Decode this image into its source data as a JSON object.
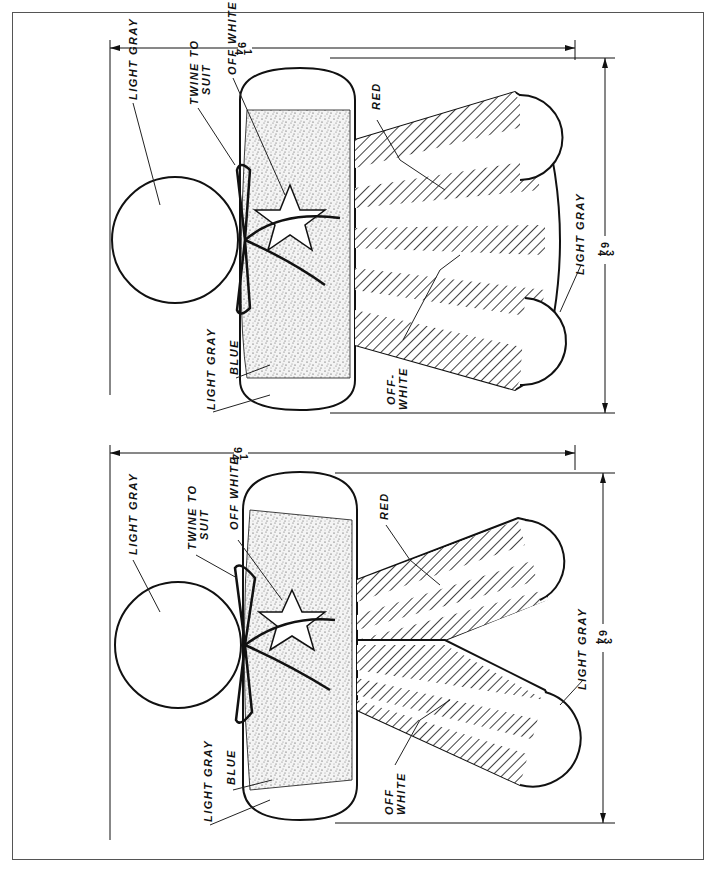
{
  "figures": [
    {
      "id": "top",
      "labels": {
        "head": "LIGHT GRAY",
        "twine_line1": "TWINE TO",
        "twine_line2": "SUIT",
        "star": "OFF WHITE",
        "stripes_red": "RED",
        "stripes_white_line1": "OFF-",
        "stripes_white_line2": "WHITE",
        "feet": "LIGHT GRAY",
        "body_blue": "BLUE",
        "hands": "LIGHT GRAY"
      },
      "dimensions": {
        "height_whole": "9",
        "height_frac_num": "1",
        "height_frac_den": "4",
        "width_whole": "6",
        "width_frac_num": "3",
        "width_frac_den": "4"
      },
      "style": "flared skirt"
    },
    {
      "id": "bottom",
      "labels": {
        "head": "LIGHT GRAY",
        "twine_line1": "TWINE TO",
        "twine_line2": "SUIT",
        "star": "OFF WHITE",
        "stripes_red": "RED",
        "stripes_white_line1": "OFF",
        "stripes_white_line2": "WHITE",
        "feet": "LIGHT GRAY",
        "body_blue": "BLUE",
        "hands": "LIGHT GRAY"
      },
      "dimensions": {
        "height_whole": "9",
        "height_frac_num": "1",
        "height_frac_den": "4",
        "width_whole": "6",
        "width_frac_num": "3",
        "width_frac_den": "4"
      },
      "style": "split legs"
    }
  ],
  "colors": {
    "ink": "#111111",
    "paper": "#ffffff",
    "frame": "#555555"
  }
}
